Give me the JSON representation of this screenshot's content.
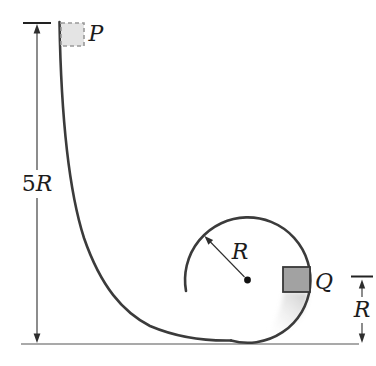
{
  "figure": {
    "labels": {
      "p": "P",
      "q": "Q",
      "loop_radius": "R",
      "q_height": "R",
      "drop_height_digit": "5",
      "drop_height_letter": "R"
    },
    "colors": {
      "track": "#3b3b3b",
      "ground": "#8c8c8c",
      "block_p_fill": "#e4e4e4",
      "block_p_border": "#999999",
      "block_q_fill": "#a2a2a2",
      "block_q_border": "#383838",
      "dimension": "#2e2e2e",
      "label_text": "#1c1c1c"
    }
  }
}
